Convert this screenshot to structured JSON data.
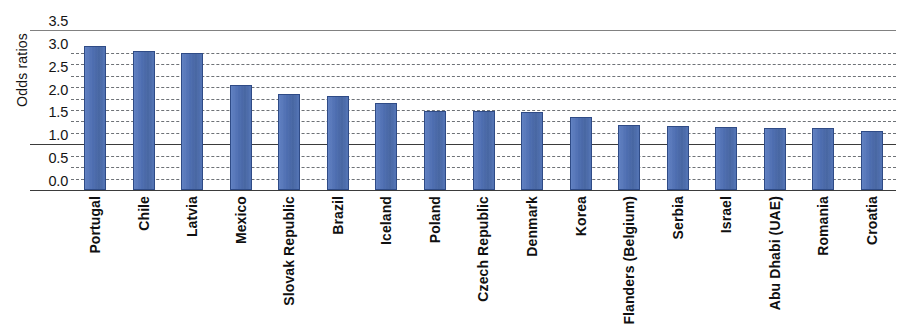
{
  "chart_data": {
    "type": "bar",
    "title": "",
    "subtitle": "",
    "xlabel": "",
    "ylabel": "Odds ratios",
    "ylim": [
      0.0,
      3.5
    ],
    "ytick_labels": [
      "0.0",
      "0.5",
      "1.0",
      "1.5",
      "2.0",
      "2.5",
      "3.0",
      "3.5"
    ],
    "ytick_values": [
      0.0,
      0.5,
      1.0,
      1.5,
      2.0,
      2.5,
      3.0,
      3.5
    ],
    "minor_gridlines": [
      0.25,
      0.75,
      1.25,
      1.75,
      2.25,
      2.75
    ],
    "grid": "horizontal-dashed",
    "reference_line": 1.0,
    "legend": null,
    "legend_position": "none",
    "bar_color": "#4869ae",
    "bar_edge_color": "#2f4b86",
    "categories": [
      "Portugal",
      "Chile",
      "Latvia",
      "Mexico",
      "Slovak Republic",
      "Brazil",
      "Iceland",
      "Poland",
      "Czech Republic",
      "Denmark",
      "Korea",
      "Flanders (Belgium)",
      "Serbia",
      "Israel",
      "Abu Dhabi (UAE)",
      "Romania",
      "Croatia"
    ],
    "values": [
      3.15,
      3.05,
      3.0,
      2.3,
      2.1,
      2.05,
      1.9,
      1.72,
      1.72,
      1.7,
      1.6,
      1.42,
      1.4,
      1.38,
      1.35,
      1.35,
      1.3
    ]
  }
}
